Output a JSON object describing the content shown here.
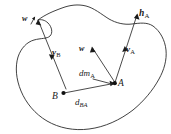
{
  "figure": {
    "type": "mechanics-diagram",
    "background_color": "#ffffff",
    "stroke_color": "#2b2b2b",
    "width": 171,
    "height": 134
  },
  "labels": {
    "omega_left": {
      "symbol": "w",
      "subscript": "",
      "text": "w"
    },
    "omega_mid": {
      "symbol": "w",
      "subscript": "",
      "text": "w"
    },
    "velocity_b": {
      "symbol": "v",
      "subscript": "B",
      "text": "vB"
    },
    "velocity_a": {
      "symbol": "v",
      "subscript": "A",
      "text": "vA"
    },
    "angular_momentum_a": {
      "symbol": "h",
      "subscript": "A",
      "text": "hA"
    },
    "mass_element_a": {
      "symbol": "dm",
      "subscript": "A",
      "text": "dmA"
    },
    "point_a": {
      "symbol": "A",
      "text": "A"
    },
    "point_b": {
      "symbol": "B",
      "text": "B"
    },
    "distance_ba": {
      "symbol": "d",
      "subscript": "BA",
      "text": "dBA"
    }
  },
  "vectors": [
    {
      "name": "omega-left-vector",
      "label": "w",
      "from": [
        66,
        89
      ],
      "to": [
        38,
        20
      ],
      "arrow_at": "both"
    },
    {
      "name": "velocity-b-vector",
      "label": "vB",
      "from": [
        40,
        24
      ],
      "to": [
        55,
        59
      ],
      "arrow_at": "end"
    },
    {
      "name": "omega-mid-vector",
      "label": "w",
      "from": [
        115,
        83
      ],
      "to": [
        92,
        47
      ],
      "arrow_at": "end"
    },
    {
      "name": "angular-momentum-a-vector",
      "label": "hA",
      "from": [
        115,
        83
      ],
      "to": [
        137,
        14
      ],
      "arrow_at": "end"
    },
    {
      "name": "velocity-a-vector",
      "label": "vA",
      "from": [
        113,
        72
      ],
      "to": [
        124,
        47
      ],
      "arrow_at": "end"
    },
    {
      "name": "distance-ba-vector",
      "label": "dBA",
      "from": [
        63,
        93
      ],
      "to": [
        114,
        83
      ],
      "arrow_at": "end"
    }
  ],
  "points": [
    {
      "name": "point-b-dot",
      "label": "B",
      "at": [
        63,
        93
      ]
    },
    {
      "name": "point-a-dot",
      "label": "A",
      "at": [
        115,
        83
      ]
    }
  ]
}
